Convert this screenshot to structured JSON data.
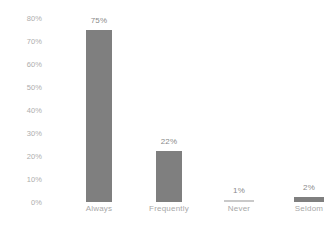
{
  "chart_data": {
    "type": "bar",
    "title": "",
    "subtitle": "",
    "xlabel": "",
    "ylabel": "",
    "categories": [
      "Always",
      "Frequently",
      "Never",
      "Seldom"
    ],
    "values": [
      75,
      22,
      1,
      2
    ],
    "data_labels": [
      "75%",
      "22%",
      "1%",
      "2%"
    ],
    "ylim": [
      0,
      80
    ],
    "y_ticks": [
      80,
      70,
      60,
      50,
      40,
      30,
      20,
      10,
      0
    ],
    "y_tick_labels": [
      "80%",
      "70%",
      "60%",
      "50%",
      "40%",
      "30%",
      "20%",
      "10%",
      "0%"
    ],
    "grid": false,
    "legend": false,
    "legend_position": "none",
    "colors": {
      "bar": "#7f7f7f",
      "bar_small": "#c9c9c9",
      "tick_label": "#adadad",
      "category_label": "#a8a8a8",
      "value_label": "#8a8a8a",
      "background": "#ffffff"
    }
  }
}
